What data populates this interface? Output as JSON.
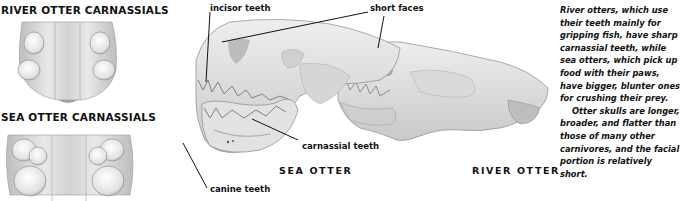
{
  "panels": {
    "river_carnassials": {
      "title": "RIVER OTTER CARNASSIALS"
    },
    "sea_carnassials": {
      "title": "SEA OTTER CARNASSIALS"
    }
  },
  "skull_diagram": {
    "labels": {
      "incisor": "incisor teeth",
      "short_faces": "short faces",
      "carnassial": "carnassial teeth",
      "canine": "canine teeth"
    },
    "species": {
      "sea": "SEA OTTER",
      "river": "RIVER OTTER"
    }
  },
  "caption": {
    "paragraph1": "River otters, which use their teeth mainly for gripping fish, have sharp carnassial teeth, while sea otters, which pick up food with their paws, have bigger, blunter ones for crushing their prey.",
    "paragraph2": "Otter skulls are longer, broader, and flatter than those of many other carnivores, and the facial portion is relatively short."
  },
  "colors": {
    "ink": "#111111",
    "bone_light": "#e6e6e6",
    "bone_mid": "#c8c8c8",
    "bone_dark": "#8f8f8f",
    "background": "#ffffff"
  }
}
